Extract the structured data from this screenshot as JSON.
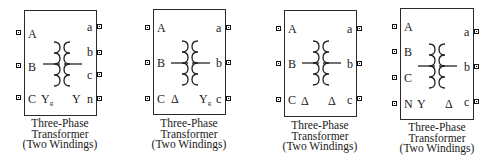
{
  "blocks": [
    {
      "caption": [
        "Three-Phase",
        "Transformer",
        "(Two Windings)"
      ],
      "left_ports": [
        "A",
        "B",
        "C"
      ],
      "right_ports": [
        "a",
        "b",
        "c",
        "n"
      ],
      "primary_connection": "Yg",
      "primary_main": "Y",
      "primary_sub": "g",
      "secondary_connection": "Y",
      "secondary_main": "Y",
      "secondary_sub": ""
    },
    {
      "caption": [
        "Three-Phase",
        "Transformer",
        "(Two Windings)"
      ],
      "left_ports": [
        "A",
        "B",
        "C"
      ],
      "right_ports": [
        "a",
        "b",
        "c"
      ],
      "primary_connection": "Δ",
      "primary_main": "Δ",
      "primary_sub": "",
      "secondary_connection": "Yg",
      "secondary_main": "Y",
      "secondary_sub": "g"
    },
    {
      "caption": [
        "Three-Phase",
        "Transformer",
        "(Two Windings)"
      ],
      "left_ports": [
        "A",
        "B",
        "C"
      ],
      "right_ports": [
        "a",
        "b",
        "c"
      ],
      "primary_connection": "Δ",
      "primary_main": "Δ",
      "primary_sub": "",
      "secondary_connection": "Δ",
      "secondary_main": "Δ",
      "secondary_sub": ""
    },
    {
      "caption": [
        "Three-Phase",
        "Transformer",
        "(Two Windings)"
      ],
      "left_ports": [
        "A",
        "B",
        "C",
        "N"
      ],
      "right_ports": [
        "a",
        "b",
        "c"
      ],
      "primary_connection": "Y",
      "primary_main": "Y",
      "primary_sub": "",
      "secondary_connection": "Δ",
      "secondary_main": "Δ",
      "secondary_sub": ""
    }
  ]
}
